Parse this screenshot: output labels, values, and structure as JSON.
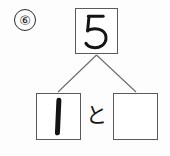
{
  "worksheet": {
    "kind": "number-bond-decomposition",
    "problem_number": "⑥",
    "instruction_language": "ja",
    "total": {
      "label": "5",
      "value": 5,
      "filled": true
    },
    "parts": [
      {
        "label": "1",
        "value": 1,
        "filled": true,
        "position": "left"
      },
      {
        "label": "",
        "value": null,
        "filled": false,
        "position": "right"
      }
    ],
    "conjunction": "と",
    "colors": {
      "background": "#fdfdfd",
      "box_border": "#5a5a5a",
      "connector": "#6b6b6b",
      "ink": "#141414",
      "circle_border": "#2b2b2b"
    }
  }
}
